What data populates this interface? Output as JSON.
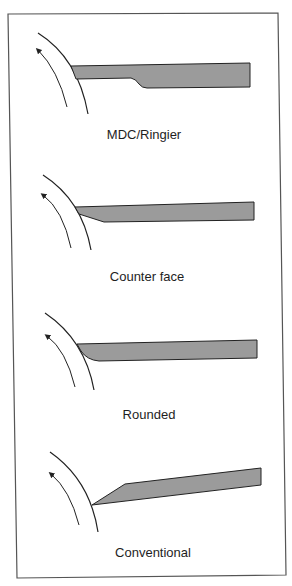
{
  "figure": {
    "background": "#ffffff",
    "frame_color": "#555555",
    "blade_fill": "#9b9b9b",
    "line_color": "#222222",
    "panels": [
      {
        "id": "mdc-ringier",
        "label": "MDC/Ringier",
        "blade_profile": "stepped"
      },
      {
        "id": "counter-face",
        "label": "Counter face",
        "blade_profile": "bevel-bottom"
      },
      {
        "id": "rounded",
        "label": "Rounded",
        "blade_profile": "rounded-bottom"
      },
      {
        "id": "conventional",
        "label": "Conventional",
        "blade_profile": "bevel-top-angled"
      }
    ]
  }
}
